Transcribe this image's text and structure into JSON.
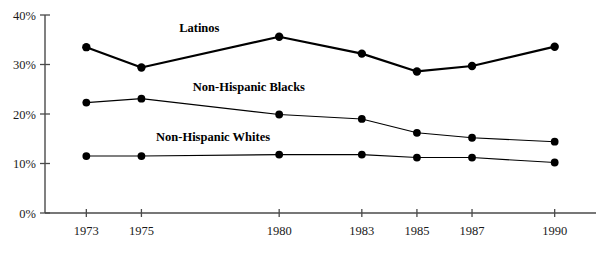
{
  "chart_data": {
    "type": "line",
    "title": "",
    "subtitle": "",
    "xlabel": "",
    "ylabel": "",
    "x": [
      1973,
      1975,
      1980,
      1983,
      1985,
      1987,
      1990
    ],
    "categories": [
      "1973",
      "1975",
      "1980",
      "1983",
      "1985",
      "1987",
      "1990"
    ],
    "xlim": [
      1971.5,
      1991.5
    ],
    "ylim": [
      0,
      40
    ],
    "y_ticks": [
      0,
      10,
      20,
      30,
      40
    ],
    "y_tick_labels": [
      "0%",
      "10%",
      "20%",
      "30%",
      "40%"
    ],
    "x_tick_labels": [
      "1973",
      "1975",
      "1980",
      "1983",
      "1985",
      "1987",
      "1990"
    ],
    "grid": false,
    "legend_position": "inline-annotations",
    "series": [
      {
        "name": "Latinos",
        "color": "#000000",
        "line_width": 2.2,
        "marker": "circle",
        "marker_size": 4.2,
        "values": [
          33.5,
          29.4,
          35.6,
          32.2,
          28.6,
          29.7,
          33.6
        ],
        "label_x": 1977.1,
        "label_y": 36.6
      },
      {
        "name": "Non-Hispanic Blacks",
        "color": "#000000",
        "line_width": 1.1,
        "marker": "circle",
        "marker_size": 3.9,
        "values": [
          22.3,
          23.1,
          19.9,
          19.0,
          16.2,
          15.2,
          14.4
        ],
        "label_x": 1978.9,
        "label_y": 24.6
      },
      {
        "name": "Non-Hispanic Whites",
        "color": "#000000",
        "line_width": 1.1,
        "marker": "circle",
        "marker_size": 3.9,
        "values": [
          11.5,
          11.5,
          11.8,
          11.8,
          11.2,
          11.2,
          10.2
        ],
        "label_x": 1977.6,
        "label_y": 14.6
      }
    ]
  },
  "axes": {
    "y_axis_name": "percent-axis",
    "x_axis_name": "year-axis"
  }
}
